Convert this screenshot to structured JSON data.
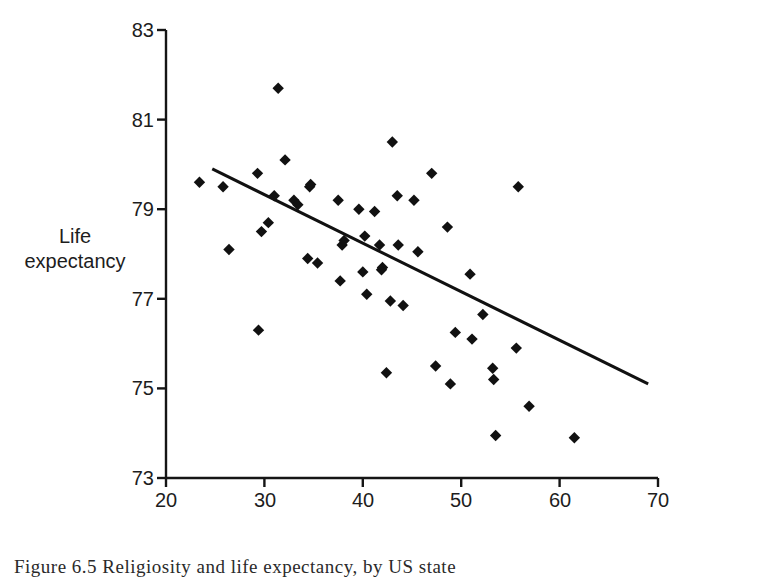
{
  "figure": {
    "caption_label": "Figure 6.5",
    "caption_text": "Religiosity and life expectancy, by US state",
    "caption_full": "Figure 6.5  Religiosity and life expectancy, by US state"
  },
  "chart_data": {
    "type": "scatter",
    "title": "",
    "xlabel": "Religious attendance, by state (percentage)",
    "ylabel_line1": "Life",
    "ylabel_line2": "expectancy",
    "ylabel": "Life expectancy",
    "xlim": [
      20,
      70
    ],
    "ylim": [
      73,
      83
    ],
    "xticks": [
      20,
      30,
      40,
      50,
      60,
      70
    ],
    "yticks": [
      73,
      75,
      77,
      79,
      81,
      83
    ],
    "xtick_labels": [
      "20",
      "30",
      "40",
      "50",
      "60",
      "70"
    ],
    "ytick_labels": [
      "73",
      "75",
      "77",
      "79",
      "81",
      "83"
    ],
    "grid": false,
    "legend": false,
    "marker": "diamond",
    "marker_color": "#111111",
    "marker_size": 7,
    "n_points": 50,
    "points": [
      [
        23.4,
        79.6
      ],
      [
        25.8,
        79.5
      ],
      [
        26.4,
        78.1
      ],
      [
        29.3,
        79.8
      ],
      [
        29.4,
        76.3
      ],
      [
        29.7,
        78.5
      ],
      [
        30.4,
        78.7
      ],
      [
        31.0,
        79.3
      ],
      [
        31.4,
        81.7
      ],
      [
        32.1,
        80.1
      ],
      [
        33.0,
        79.2
      ],
      [
        33.4,
        79.1
      ],
      [
        34.4,
        77.9
      ],
      [
        34.6,
        79.5
      ],
      [
        34.7,
        79.55
      ],
      [
        35.4,
        77.8
      ],
      [
        37.5,
        79.2
      ],
      [
        37.7,
        77.4
      ],
      [
        37.9,
        78.2
      ],
      [
        38.1,
        78.3
      ],
      [
        39.6,
        79.0
      ],
      [
        40.0,
        77.6
      ],
      [
        40.2,
        78.4
      ],
      [
        40.4,
        77.1
      ],
      [
        41.2,
        78.95
      ],
      [
        41.7,
        78.2
      ],
      [
        41.9,
        77.65
      ],
      [
        42.0,
        77.7
      ],
      [
        42.4,
        75.35
      ],
      [
        42.8,
        76.95
      ],
      [
        43.0,
        80.5
      ],
      [
        43.5,
        79.3
      ],
      [
        43.6,
        78.2
      ],
      [
        44.1,
        76.85
      ],
      [
        45.2,
        79.2
      ],
      [
        45.6,
        78.05
      ],
      [
        47.0,
        79.8
      ],
      [
        47.4,
        75.5
      ],
      [
        48.6,
        78.6
      ],
      [
        48.9,
        75.1
      ],
      [
        49.4,
        76.25
      ],
      [
        50.9,
        77.55
      ],
      [
        51.1,
        76.1
      ],
      [
        52.2,
        76.65
      ],
      [
        53.2,
        75.45
      ],
      [
        53.3,
        75.2
      ],
      [
        53.5,
        73.95
      ],
      [
        55.6,
        75.9
      ],
      [
        55.8,
        79.5
      ],
      [
        56.9,
        74.6
      ],
      [
        61.5,
        73.9
      ]
    ],
    "trendline": {
      "visible": true,
      "color": "#111111",
      "width": 3,
      "x_start": 24.7,
      "y_start": 79.9,
      "x_end": 69.0,
      "y_end": 75.1,
      "direction": "negative"
    }
  }
}
